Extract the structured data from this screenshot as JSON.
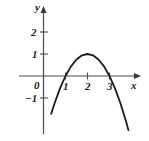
{
  "chart_data": {
    "type": "line",
    "title": "",
    "subtitle": "",
    "xlabel": "x",
    "ylabel": "y",
    "equation": "y = -(x - 2)^2 + 1",
    "xlim": [
      -1.1,
      4.4
    ],
    "ylim": [
      -2.9,
      2.9
    ],
    "grid": false,
    "legend": null,
    "x_ticks": [
      1,
      2,
      3
    ],
    "x_tick_labels": [
      "1",
      "2",
      "3"
    ],
    "y_ticks": [
      2,
      1,
      -1
    ],
    "y_tick_labels": [
      "2",
      "1",
      "−1"
    ],
    "origin_label": "0",
    "axis_arrows": [
      "x-positive",
      "y-positive"
    ],
    "roots": [
      1,
      3
    ],
    "vertex": [
      2,
      1
    ],
    "series": [
      {
        "name": "parabola",
        "color": "#1b1b1b",
        "x": [
          0.35,
          0.5,
          0.75,
          1.0,
          1.25,
          1.5,
          1.75,
          2.0,
          2.25,
          2.5,
          2.75,
          3.0,
          3.25,
          3.5,
          3.75,
          3.86
        ],
        "y": [
          -1.72,
          -1.25,
          -0.56,
          0.0,
          0.44,
          0.75,
          0.94,
          1.0,
          0.94,
          0.75,
          0.44,
          0.0,
          -0.56,
          -1.25,
          -2.06,
          -2.46
        ]
      }
    ]
  },
  "labels": {
    "y_axis_name": "y",
    "x_axis_name": "x",
    "y_tick_2": "2",
    "y_tick_1": "1",
    "y_tick_neg1": "−1",
    "origin": "0",
    "x_tick_1": "1",
    "x_tick_2": "2",
    "x_tick_3": "3"
  },
  "colors": {
    "background": "#ffffff",
    "axis": "#4a4a4a",
    "curve": "#1b1b1b",
    "text": "#1b1b1b"
  }
}
